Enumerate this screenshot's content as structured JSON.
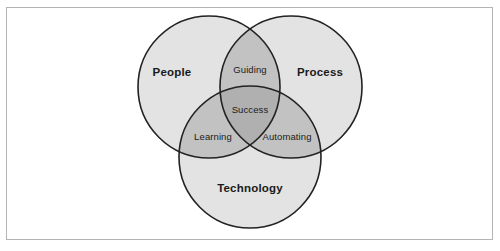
{
  "figure": {
    "type": "venn-diagram-3-set",
    "background_color": "#ffffff",
    "frame_border_color": "#b4b4b4",
    "circle_outline_color": "#222222",
    "fill_single": "#e3e3e3",
    "fill_double": "#c2c2c2",
    "fill_triple": "#b0b0b0",
    "text_color": "#1a1a1a"
  },
  "sets": [
    {
      "id": "people",
      "label": "People",
      "cx": 209,
      "cy": 87,
      "r": 71,
      "label_x": 172,
      "label_y": 73
    },
    {
      "id": "process",
      "label": "Process",
      "cx": 291,
      "cy": 87,
      "r": 71,
      "label_x": 320,
      "label_y": 73
    },
    {
      "id": "technology",
      "label": "Technology",
      "cx": 250,
      "cy": 157,
      "r": 71,
      "label_x": 250,
      "label_y": 189
    }
  ],
  "intersections": [
    {
      "id": "people-process",
      "label": "Guiding",
      "label_x": 250,
      "label_y": 70,
      "sets": "People + Process"
    },
    {
      "id": "people-technology",
      "label": "Learning",
      "label_x": 213,
      "label_y": 137,
      "sets": "People + Technology"
    },
    {
      "id": "process-technology",
      "label": "Automating",
      "label_x": 287,
      "label_y": 137,
      "sets": "Process + Technology"
    },
    {
      "id": "people-process-technology",
      "label": "Success",
      "label_x": 250,
      "label_y": 110,
      "sets": "People + Process + Technology"
    }
  ]
}
